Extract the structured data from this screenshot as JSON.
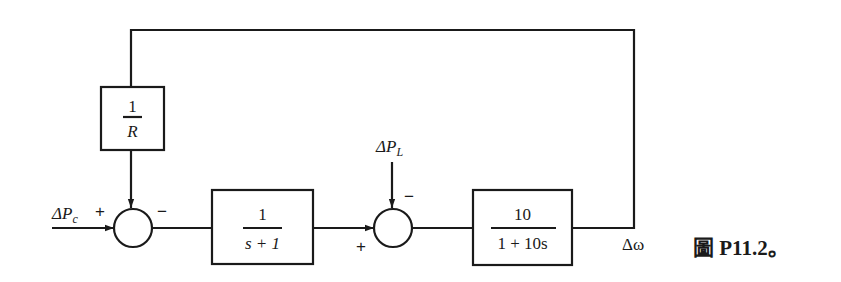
{
  "diagram": {
    "type": "block-diagram",
    "caption": "圖 P11.2。",
    "inputs": {
      "reference": "ΔP",
      "reference_sub": "c",
      "load": "ΔP",
      "load_sub": "L"
    },
    "output": "Δω",
    "blocks": [
      {
        "id": "droop",
        "num": "1",
        "den": "R"
      },
      {
        "id": "governor",
        "num": "1",
        "den": "s + 1"
      },
      {
        "id": "plant",
        "num": "10",
        "den": "1 + 10s"
      }
    ],
    "summers": [
      {
        "id": "sum1",
        "signs": {
          "reference": "+",
          "feedback": "−"
        }
      },
      {
        "id": "sum2",
        "signs": {
          "governor": "+",
          "load": "−"
        }
      }
    ]
  }
}
